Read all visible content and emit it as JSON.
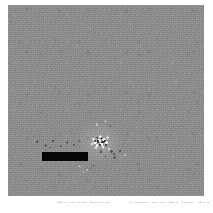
{
  "figure": {
    "name": "grayscale-noise-image",
    "panel": {
      "background_color": "#8f8f8f",
      "width_px": 196,
      "height_px": 191,
      "left_px": 8,
      "top_px": 5
    },
    "page_background_color": "#ffffff"
  },
  "annotations": {
    "dark_bar": {
      "label": "scale-bar",
      "color": "#070707",
      "left_px": 42,
      "top_px": 152,
      "width_px": 46,
      "height_px": 9
    },
    "bright_cluster": {
      "label": "bright-speckle-cluster",
      "highlight_color": "#ffffff",
      "shadow_color": "#000000",
      "left_px": 86,
      "top_px": 129,
      "width_px": 30,
      "height_px": 26
    },
    "speck_fields": [
      {
        "label": "specks-left-of-bar",
        "left_px": 32,
        "top_px": 138,
        "width_px": 52,
        "height_px": 12
      },
      {
        "label": "specks-right-of-bar",
        "left_px": 96,
        "top_px": 146,
        "width_px": 34,
        "height_px": 14
      },
      {
        "label": "specks-below-bar",
        "left_px": 72,
        "top_px": 162,
        "width_px": 34,
        "height_px": 14
      },
      {
        "label": "specks-above-bar",
        "left_px": 88,
        "top_px": 118,
        "width_px": 30,
        "height_px": 12
      },
      {
        "label": "specks-far-right",
        "left_px": 108,
        "top_px": 146,
        "width_px": 12,
        "height_px": 16
      }
    ]
  },
  "caption": {
    "visibility": "clipped-at-image-bottom-edge",
    "color": "#b9b9b9",
    "left_fragment": "the quick brown",
    "right_fragment": "jumps over the lazy dog"
  }
}
